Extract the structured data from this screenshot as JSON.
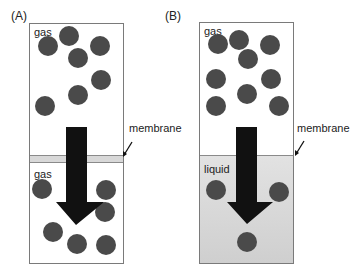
{
  "panels": {
    "A": {
      "label": "(A)",
      "top_phase": "gas",
      "bottom_phase": "gas",
      "membrane_label": "membrane",
      "top_molecules": [
        [
          48,
          46
        ],
        [
          69,
          36
        ],
        [
          100,
          46
        ],
        [
          78,
          58
        ],
        [
          101,
          80
        ],
        [
          78,
          95
        ],
        [
          45,
          106
        ]
      ],
      "bottom_molecules": [
        [
          42,
          189
        ],
        [
          106,
          190
        ],
        [
          105,
          212
        ],
        [
          53,
          232
        ],
        [
          77,
          244
        ],
        [
          106,
          245
        ]
      ]
    },
    "B": {
      "label": "(B)",
      "top_phase": "gas",
      "bottom_phase": "liquid",
      "membrane_label": "membrane",
      "top_molecules": [
        [
          218,
          44
        ],
        [
          239,
          40
        ],
        [
          270,
          45
        ],
        [
          248,
          59
        ],
        [
          216,
          79
        ],
        [
          271,
          79
        ],
        [
          247,
          94
        ],
        [
          216,
          106
        ],
        [
          279,
          106
        ]
      ],
      "bottom_molecules": [
        [
          216,
          190
        ],
        [
          279,
          192
        ],
        [
          247,
          242
        ]
      ]
    }
  },
  "colors": {
    "molecule": "#4a4a4a",
    "arrow": "#111111",
    "membrane": "#d8d8d8",
    "liquid": "#d9d9d9",
    "border": "#7a7a7a"
  }
}
